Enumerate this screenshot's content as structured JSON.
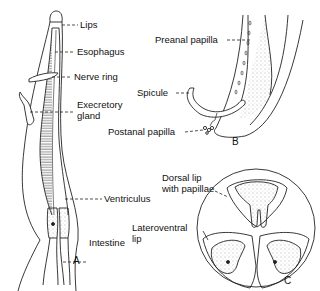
{
  "figure": {
    "panels": [
      {
        "id": "A",
        "label": "A",
        "title": "Anterior end of nematode"
      },
      {
        "id": "B",
        "label": "B",
        "title": "Male posterior end"
      },
      {
        "id": "C",
        "label": "C",
        "title": "En face view of lips"
      }
    ],
    "labels": {
      "lips": "Lips",
      "esophagus": "Esophagus",
      "nerve_ring": "Nerve ring",
      "excretory_gland_1": "Execretory",
      "excretory_gland_2": "gland",
      "ventriculus": "Ventriculus",
      "intestine": "Intestine",
      "preanal_papilla": "Preanal papilla",
      "spicule": "Spicule",
      "postanal_papilla": "Postanal papilla",
      "dorsal_lip_1": "Dorsal lip",
      "dorsal_lip_2": "with papillae",
      "lateroventral_lip_1": "Lateroventral",
      "lateroventral_lip_2": "lip"
    }
  }
}
